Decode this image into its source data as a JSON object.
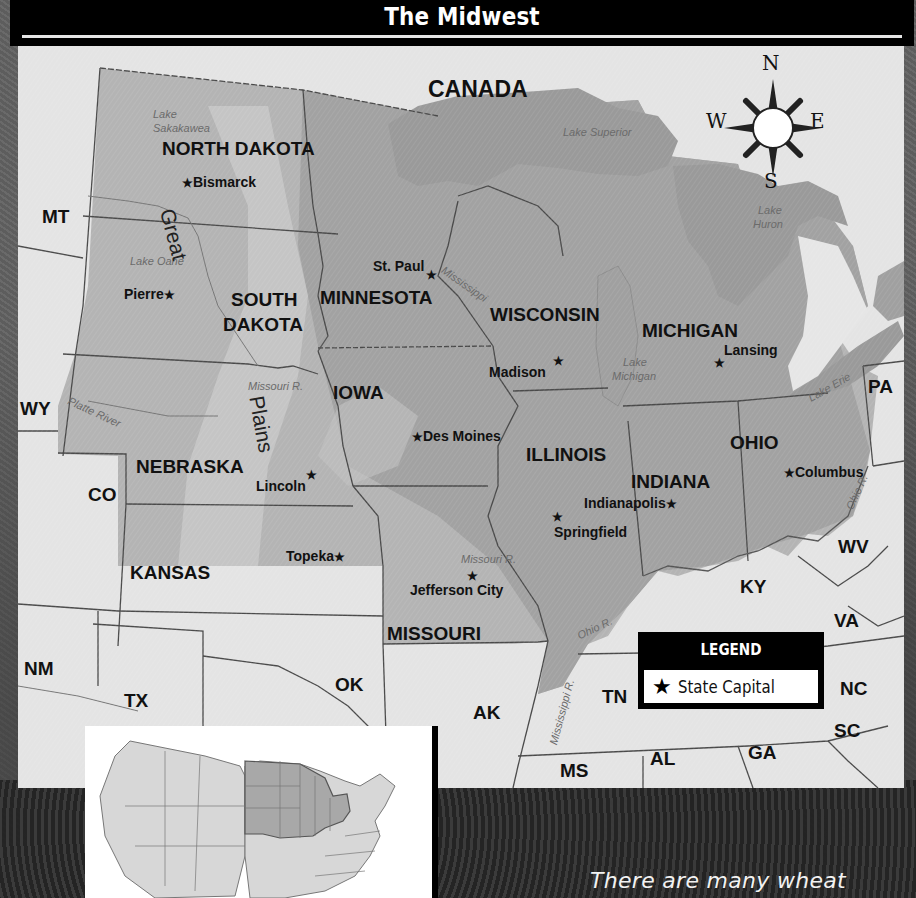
{
  "title": "The Midwest",
  "caption": "There are many wheat",
  "colors": {
    "title_bar": "#000000",
    "map_background": "#e4e4e4",
    "midwest_fill": "#a8a8a8",
    "midwest_dark": "#8f8f8f",
    "midwest_light": "#c6c6c6",
    "lake_fill": "#9c9c9c",
    "border": "#4a4a4a"
  },
  "compass": {
    "north": "N",
    "south": "S",
    "east": "E",
    "west": "W"
  },
  "countries": [
    {
      "name": "CANADA"
    }
  ],
  "midwest_states": [
    {
      "name": "NORTH DAKOTA",
      "capital": "Bismarck"
    },
    {
      "name": "SOUTH",
      "name2": "DAKOTA",
      "capital": "Pierre"
    },
    {
      "name": "MINNESOTA",
      "capital": "St. Paul"
    },
    {
      "name": "WISCONSIN",
      "capital": "Madison"
    },
    {
      "name": "MICHIGAN",
      "capital": "Lansing"
    },
    {
      "name": "IOWA",
      "capital": "Des Moines"
    },
    {
      "name": "NEBRASKA",
      "capital": "Lincoln"
    },
    {
      "name": "ILLINOIS",
      "capital": "Springfield"
    },
    {
      "name": "INDIANA",
      "capital": "Indianapolis"
    },
    {
      "name": "OHIO",
      "capital": "Columbus"
    },
    {
      "name": "KANSAS",
      "capital": "Topeka"
    },
    {
      "name": "MISSOURI",
      "capital": "Jefferson City"
    }
  ],
  "neighbor_states": [
    "MT",
    "WY",
    "CO",
    "NM",
    "TX",
    "OK",
    "AK",
    "TN",
    "MS",
    "AL",
    "GA",
    "SC",
    "NC",
    "VA",
    "KY",
    "WV",
    "PA"
  ],
  "water_features": {
    "lake_sakakawea_1": "Lake",
    "lake_sakakawea_2": "Sakakawea",
    "lake_oahe": "Lake Oahe",
    "lake_superior": "Lake Superior",
    "lake_huron_1": "Lake",
    "lake_huron_2": "Huron",
    "lake_michigan_1": "Lake",
    "lake_michigan_2": "Michigan",
    "lake_erie": "Lake Erie",
    "mississippi_north": "Mississippi",
    "mississippi_south": "Mississippi R.",
    "missouri_r_north": "Missouri R.",
    "missouri_r_south": "Missouri R.",
    "platte_river": "Platte River",
    "ohio_r_south": "Ohio R.",
    "ohio_r_east": "Ohio R."
  },
  "region_label": {
    "word1": "Great",
    "word2": "Plains"
  },
  "legend": {
    "title": "LEGEND",
    "items": [
      {
        "symbol": "★",
        "label": "State Capital"
      }
    ]
  },
  "star_symbol": "★",
  "inset": {
    "description": "US locator map with Midwest states highlighted"
  }
}
